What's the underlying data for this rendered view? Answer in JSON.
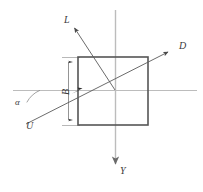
{
  "figure": {
    "type": "technical-line-diagram",
    "background_color": "#ffffff",
    "stroke_color_axes": "#b8b8b8",
    "stroke_color_shape": "#4a4a4a",
    "stroke_color_rays": "#5a5a5a",
    "label_color": "#3a3a3a"
  },
  "labels": {
    "ray_l": "L",
    "ray_d": "D",
    "ray_u": "U",
    "axis_y": "Y",
    "angle_alpha": "α",
    "dimension_b": "B"
  },
  "geometry": {
    "origin": {
      "x": 115,
      "y": 90
    },
    "square": {
      "left": 78,
      "top": 57,
      "right": 148,
      "bottom": 125
    },
    "x_axis": {
      "x1": 13,
      "y1": 90,
      "x2": 197,
      "y2": 90
    },
    "y_axis": {
      "x1": 115,
      "y1": 10,
      "x2": 115,
      "y2": 168
    },
    "ray_l": {
      "x1": 115,
      "y1": 90,
      "x2": 72,
      "y2": 25
    },
    "ray_ud": {
      "x1": 26,
      "y1": 124,
      "x2": 172,
      "y2": 50
    },
    "dimension_b_line": {
      "x": 68,
      "y1": 57,
      "y2": 125
    },
    "angle_alpha_arc": {
      "cx": 13,
      "cy": 90,
      "radius": 26,
      "sweep_deg": 27
    }
  }
}
